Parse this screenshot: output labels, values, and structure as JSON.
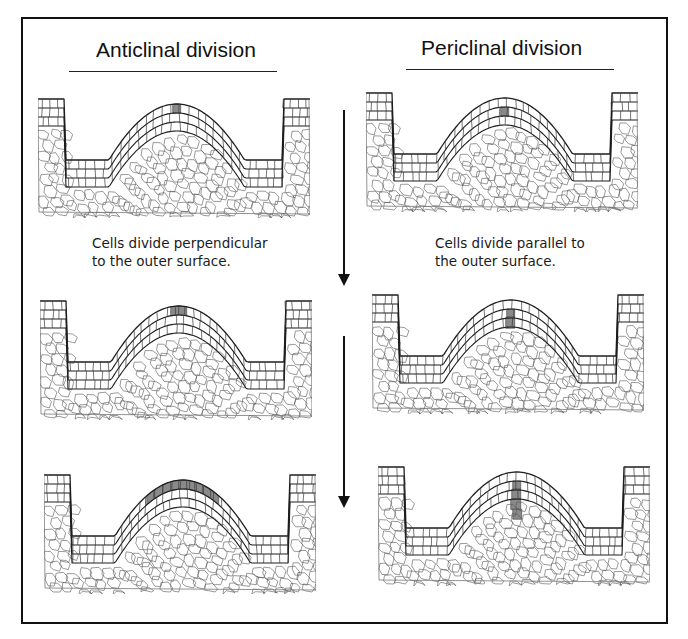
{
  "figure": {
    "columns": [
      {
        "id": "anticlinal",
        "heading": "Anticlinal division",
        "caption_line1": "Cells divide perpendicular",
        "caption_line2": "to the outer surface.",
        "panels": [
          {
            "stage": 1,
            "shaded": "single outer-layer cell at apex (L1)"
          },
          {
            "stage": 2,
            "shaded": "two adjacent outer-layer cells at apex (L1)"
          },
          {
            "stage": 3,
            "shaded": "row of ~8 outer-layer cells along dome (L1)"
          }
        ]
      },
      {
        "id": "periclinal",
        "heading": "Periclinal division",
        "caption_line1": "Cells divide parallel to",
        "caption_line2": "the outer surface.",
        "panels": [
          {
            "stage": 1,
            "shaded": "single second-layer cell at apex (L2)"
          },
          {
            "stage": 2,
            "shaded": "two stacked cells at apex (L2/L3)"
          },
          {
            "stage": 3,
            "shaded": "vertical column of ~4 stacked cells"
          }
        ]
      }
    ],
    "arrows": [
      {
        "direction": "down",
        "meaning": "stage 1 to stage 2"
      },
      {
        "direction": "down",
        "meaning": "stage 2 to stage 3"
      }
    ],
    "colors": {
      "shade": "#8a8a8a",
      "cell_wall": "#3a3a3a",
      "layer_line": "#1e1e1e",
      "frame": "#111111"
    }
  }
}
